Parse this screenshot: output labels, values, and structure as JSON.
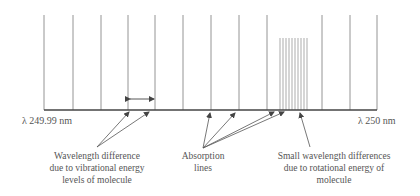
{
  "diagram": {
    "axis": {
      "left_label": "λ 249.99 nm",
      "right_label": "λ 250 nm",
      "x_start": 44,
      "x_end": 377,
      "y": 110
    },
    "vibrational_lines_x": [
      44,
      73,
      101,
      128,
      155,
      183,
      211,
      239,
      267,
      322,
      350,
      377
    ],
    "rotational_lines_x": [
      280,
      283,
      286,
      289,
      292,
      295,
      298,
      301,
      304,
      307
    ],
    "line_top_y": 15,
    "rotational_top_y": 38,
    "annotations": [
      {
        "id": "vibrational",
        "lines": [
          "Wavelength difference",
          "due to vibrational energy",
          "levels of molecule"
        ]
      },
      {
        "id": "absorption",
        "lines": [
          "Absorption",
          "lines"
        ]
      },
      {
        "id": "rotational",
        "lines": [
          "Small wavelength differences",
          "due to rotational energy of",
          "molecule"
        ]
      }
    ],
    "colors": {
      "line": "#888888",
      "axis": "#444444",
      "text": "#555555"
    }
  }
}
